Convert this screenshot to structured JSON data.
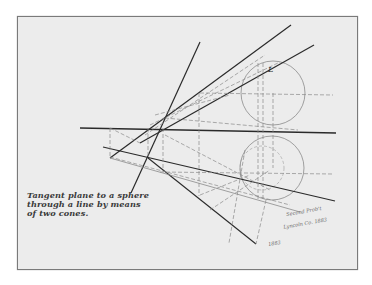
{
  "drawing": {
    "title_lines": [
      "Tangent plane to a sphere",
      "through a line by means",
      "of two cones."
    ],
    "annotations": {
      "label_upper": "L",
      "signature_lines": [
        "Second Prob't",
        "Lyncoln Co. 1883",
        "1883"
      ]
    },
    "colors": {
      "paper": "#ececec",
      "ink": "#2a2a2a",
      "construction": "#8a8a8a",
      "border": "#7a7a7a"
    }
  }
}
